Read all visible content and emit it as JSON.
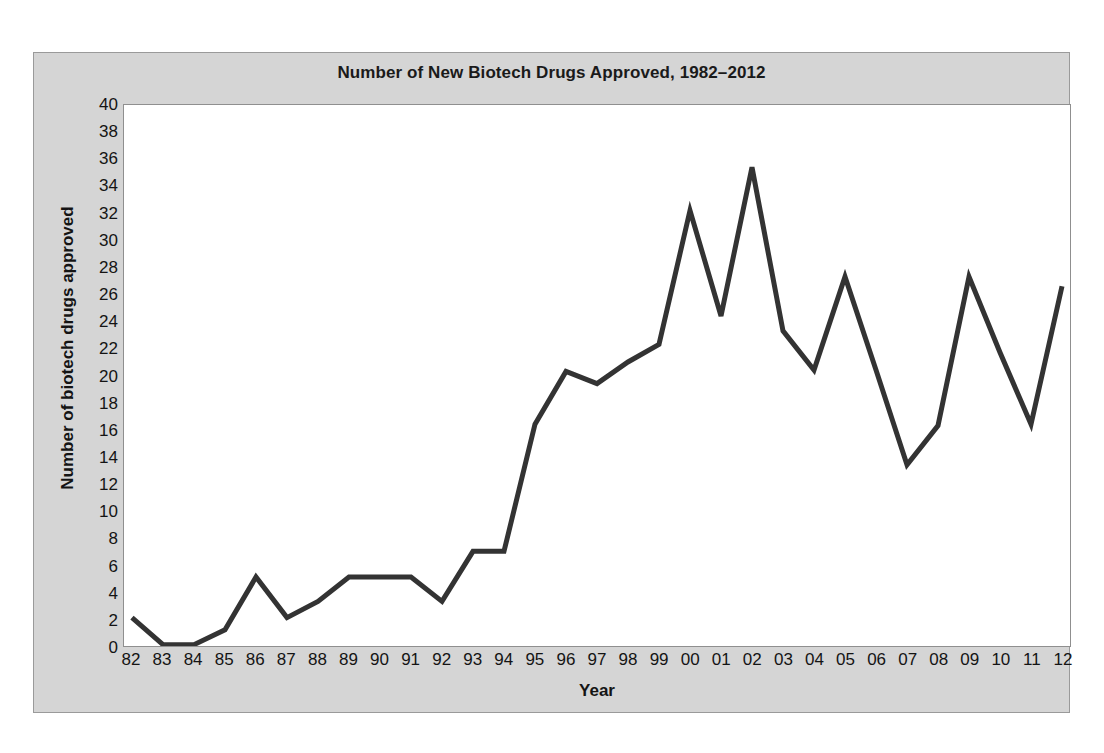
{
  "chart_data": {
    "type": "line",
    "title": "Number of New Biotech Drugs Approved, 1982–2012",
    "xlabel": "Year",
    "ylabel": "Number of biotech drugs approved",
    "xlim": [
      1982,
      2012
    ],
    "ylim": [
      0,
      40
    ],
    "y_ticks": [
      0,
      2,
      4,
      6,
      8,
      10,
      12,
      14,
      16,
      18,
      20,
      22,
      24,
      26,
      28,
      30,
      32,
      34,
      36,
      38,
      40
    ],
    "grid": false,
    "legend": "none",
    "line_color": "#333333",
    "plot_background": "#ffffff",
    "frame_background": "#d5d5d5",
    "categories": [
      "82",
      "83",
      "84",
      "85",
      "86",
      "87",
      "88",
      "89",
      "90",
      "91",
      "92",
      "93",
      "94",
      "95",
      "96",
      "97",
      "98",
      "99",
      "00",
      "01",
      "02",
      "03",
      "04",
      "05",
      "06",
      "07",
      "08",
      "09",
      "10",
      "11",
      "12"
    ],
    "values": [
      2.1,
      0.1,
      0.1,
      1.2,
      5.1,
      2.1,
      3.3,
      5.1,
      5.1,
      5.1,
      3.3,
      7.0,
      7.0,
      16.4,
      20.3,
      19.4,
      21.0,
      22.3,
      32.2,
      24.4,
      35.4,
      23.3,
      20.4,
      27.3,
      20.4,
      13.4,
      16.3,
      27.3,
      21.7,
      16.4,
      26.6
    ],
    "series": [
      {
        "name": "Biotech drugs approved",
        "values": [
          2.1,
          0.1,
          0.1,
          1.2,
          5.1,
          2.1,
          3.3,
          5.1,
          5.1,
          5.1,
          3.3,
          7.0,
          7.0,
          16.4,
          20.3,
          19.4,
          21.0,
          22.3,
          32.2,
          24.4,
          35.4,
          23.3,
          20.4,
          27.3,
          20.4,
          13.4,
          16.3,
          27.3,
          21.7,
          16.4,
          26.6
        ]
      }
    ]
  }
}
